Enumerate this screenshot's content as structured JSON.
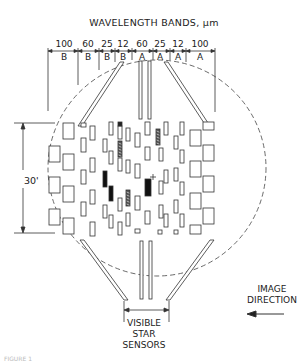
{
  "title": "WAVELENGTH BANDS, μm",
  "bands": [
    {
      "value": "100",
      "label": "B",
      "x": 64
    },
    {
      "value": "60",
      "label": "B",
      "x": 88
    },
    {
      "value": "25",
      "label": "B",
      "x": 107
    },
    {
      "value": "12",
      "label": "B",
      "x": 123
    },
    {
      "value": "60",
      "label": "A",
      "x": 142
    },
    {
      "value": "25",
      "label": "A",
      "x": 160
    },
    {
      "value": "12",
      "label": "A",
      "x": 178
    },
    {
      "value": "100",
      "label": "A",
      "x": 200
    }
  ],
  "band_boundaries_x": [
    48,
    78,
    99,
    115,
    132,
    153,
    170,
    186,
    215
  ],
  "field_height_label": "30'",
  "star_sensors_label": "VISIBLE STAR SENSORS",
  "image_direction_label": "IMAGE DIRECTION",
  "caption": "FIGURE 1",
  "colors": {
    "line": "#333333",
    "fill_dark": "#111111",
    "background": "#ffffff"
  },
  "detectors": {
    "columns": [
      {
        "x": 49,
        "w": 11,
        "h": 16,
        "ys": [
          146,
          177,
          209
        ]
      },
      {
        "x": 63,
        "w": 11,
        "h": 16,
        "ys": [
          123,
          154,
          186,
          218
        ]
      },
      {
        "x": 81,
        "w": 5,
        "h": 14,
        "ys": [
          138,
          170,
          202
        ],
        "top_small": [
          81,
          123,
          5,
          4
        ]
      },
      {
        "x": 90,
        "w": 5,
        "h": 14,
        "ys": [
          126,
          158,
          190,
          222
        ]
      },
      {
        "x": 103,
        "w": 4,
        "h": 13,
        "ys": [
          139,
          205
        ],
        "dark": [
          [
            103,
            171,
            4,
            16
          ]
        ]
      },
      {
        "x": 109,
        "w": 4,
        "h": 13,
        "ys": [
          122,
          151,
          215
        ],
        "dark": [
          [
            109,
            186,
            4,
            15
          ]
        ]
      },
      {
        "x": 118,
        "w": 4,
        "h": 13,
        "ys": [
          126,
          158,
          198,
          222
        ],
        "hatched": [
          [
            118,
            141,
            4,
            16
          ]
        ],
        "hatched2": [
          [
            126,
            190,
            4,
            16
          ]
        ]
      },
      {
        "x": 126,
        "w": 4,
        "h": 13,
        "ys": [
          128,
          160,
          213
        ],
        "top_small_dark": [
          118,
          122,
          4,
          4
        ]
      },
      {
        "x": 135,
        "w": 5,
        "h": 14,
        "ys": [
          133,
          164,
          196
        ],
        "bottom_small": [
          135,
          229,
          5,
          4
        ]
      },
      {
        "x": 145,
        "w": 5,
        "h": 13,
        "ys": [
          122,
          147,
          211
        ],
        "dark": [
          [
            145,
            179,
            6,
            17
          ]
        ]
      },
      {
        "x": 159,
        "w": 4,
        "h": 13,
        "ys": [
          148,
          181,
          205
        ],
        "hatched": [
          [
            156,
            129,
            4,
            16
          ]
        ],
        "bottom_small": [
          158,
          230,
          4,
          4
        ]
      },
      {
        "x": 164,
        "w": 4,
        "h": 13,
        "ys": [
          122,
          170,
          214
        ]
      },
      {
        "x": 174,
        "w": 4,
        "h": 13,
        "ys": [
          136,
          168,
          200
        ],
        "bottom_small": [
          174,
          230,
          4,
          4
        ]
      },
      {
        "x": 180,
        "w": 4,
        "h": 13,
        "ys": [
          122,
          150,
          182,
          214
        ]
      },
      {
        "x": 190,
        "w": 11,
        "h": 16,
        "ys": [
          130,
          161,
          193
        ],
        "bottom": [
          190,
          225,
          11,
          9
        ]
      },
      {
        "x": 203,
        "w": 11,
        "h": 16,
        "ys": [
          145,
          176,
          208
        ],
        "top": [
          203,
          122,
          11,
          8
        ]
      }
    ],
    "plus_marker": {
      "x": 153,
      "y": 177
    }
  }
}
